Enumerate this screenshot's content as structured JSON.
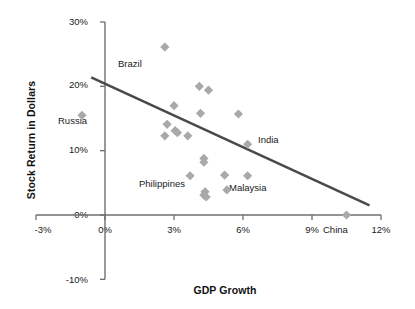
{
  "chart_data": {
    "type": "scatter",
    "title": "",
    "xlabel": "GDP Growth",
    "ylabel": "Stock Return in Dollars",
    "xlim": [
      -3,
      12
    ],
    "ylim": [
      -10,
      30
    ],
    "xticks": [
      "-3%",
      "0%",
      "3%",
      "6%",
      "9%",
      "12%"
    ],
    "xtick_values": [
      -3,
      0,
      3,
      6,
      9,
      12
    ],
    "yticks": [
      "30%",
      "20%",
      "10%",
      "0%",
      "-10%"
    ],
    "ytick_values": [
      30,
      20,
      10,
      0,
      -10
    ],
    "grid": false,
    "legend": null,
    "marker": {
      "shape": "diamond",
      "color": "#a9a9a9"
    },
    "points": [
      {
        "x": -1.0,
        "y": 15.5,
        "label": "Russia"
      },
      {
        "x": 2.6,
        "y": 26.1,
        "label": "Brazil"
      },
      {
        "x": 6.2,
        "y": 11.0,
        "label": "India"
      },
      {
        "x": 10.5,
        "y": 0.0,
        "label": "China"
      },
      {
        "x": 4.35,
        "y": 3.6,
        "label": "Philippines"
      },
      {
        "x": 5.3,
        "y": 3.9,
        "label": "Malaysia"
      },
      {
        "x": 2.7,
        "y": 14.1,
        "label": ""
      },
      {
        "x": 2.6,
        "y": 12.3,
        "label": ""
      },
      {
        "x": 3.0,
        "y": 17.0,
        "label": ""
      },
      {
        "x": 3.05,
        "y": 13.1,
        "label": ""
      },
      {
        "x": 3.15,
        "y": 12.8,
        "label": ""
      },
      {
        "x": 3.6,
        "y": 12.3,
        "label": ""
      },
      {
        "x": 4.1,
        "y": 20.0,
        "label": ""
      },
      {
        "x": 4.5,
        "y": 19.4,
        "label": ""
      },
      {
        "x": 4.15,
        "y": 15.8,
        "label": ""
      },
      {
        "x": 5.8,
        "y": 15.7,
        "label": ""
      },
      {
        "x": 4.3,
        "y": 8.8,
        "label": ""
      },
      {
        "x": 4.3,
        "y": 8.2,
        "label": ""
      },
      {
        "x": 3.7,
        "y": 6.1,
        "label": ""
      },
      {
        "x": 5.2,
        "y": 6.2,
        "label": ""
      },
      {
        "x": 6.2,
        "y": 6.1,
        "label": ""
      },
      {
        "x": 4.3,
        "y": 3.1,
        "label": ""
      },
      {
        "x": 4.4,
        "y": 2.8,
        "label": ""
      }
    ],
    "trendline": {
      "x_start": -0.6,
      "y_start": 21.4,
      "x_end": 11.5,
      "y_end": 1.5,
      "color": "#4a4a4a"
    }
  },
  "axis": {
    "y_title": "Stock Return in Dollars",
    "x_title": "GDP Growth",
    "yticks": [
      {
        "text": "30%"
      },
      {
        "text": "20%"
      },
      {
        "text": "10%"
      },
      {
        "text": "0%"
      },
      {
        "text": "-10%"
      }
    ],
    "xticks": [
      {
        "text": "-3%"
      },
      {
        "text": "0%"
      },
      {
        "text": "3%"
      },
      {
        "text": "6%"
      },
      {
        "text": "9%"
      },
      {
        "text": "12%"
      }
    ]
  },
  "labels": {
    "brazil": "Brazil",
    "russia": "Russia",
    "india": "India",
    "china": "China",
    "philippines": "Philippines",
    "malaysia": "Malaysia"
  }
}
